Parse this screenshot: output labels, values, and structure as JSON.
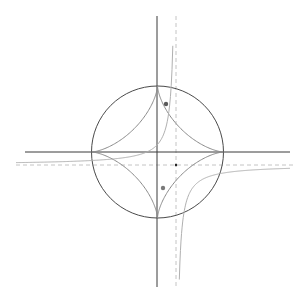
{
  "canvas": {
    "width": 308,
    "height": 303,
    "background": "#ffffff"
  },
  "colors": {
    "axis": "#3a3a3a",
    "circle": "#4a4a4a",
    "astroid": "#8a8a8a",
    "hyperbola": "#b0b0b0",
    "asymptote": "#c4c4c4",
    "point_a": "#5a5a5a",
    "point_b": "#7a7a7a",
    "center_point": "#222222"
  },
  "axes": {
    "horizontal": {
      "x1": 25,
      "x2": 290,
      "y": 152
    },
    "vertical": {
      "x": 157,
      "y1": 16,
      "y2": 287
    }
  },
  "circle": {
    "cx": 157.5,
    "cy": 152,
    "r": 66
  },
  "astroid": {
    "cx": 157.5,
    "cy": 152,
    "r": 66
  },
  "hyperbola": {
    "cx": 176,
    "cy": 165,
    "k": 380,
    "branch_upper_left": {
      "x_from": 16,
      "x_to": 173.6
    },
    "branch_lower_right": {
      "x_from": 178.2,
      "x_to": 290
    }
  },
  "asymptotes": {
    "horizontal": {
      "x1": 16,
      "x2": 295,
      "y": 165
    },
    "vertical": {
      "x": 176,
      "y1": 16,
      "y2": 287
    }
  },
  "points": [
    {
      "name": "point-a",
      "x": 166,
      "y": 104,
      "r": 2.2
    },
    {
      "name": "point-b",
      "x": 163,
      "y": 188,
      "r": 2.2
    },
    {
      "name": "hyperbola-center",
      "x": 176,
      "y": 165,
      "r": 1.2
    }
  ]
}
